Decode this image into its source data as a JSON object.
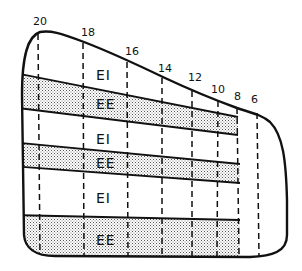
{
  "diagram": {
    "station_labels": [
      {
        "text": "20",
        "x": 33,
        "y": 25
      },
      {
        "text": "18",
        "x": 81,
        "y": 36
      },
      {
        "text": "16",
        "x": 125,
        "y": 55
      },
      {
        "text": "14",
        "x": 158,
        "y": 72
      },
      {
        "text": "12",
        "x": 188,
        "y": 81
      },
      {
        "text": "10",
        "x": 211,
        "y": 93
      },
      {
        "text": "8",
        "x": 234,
        "y": 100
      },
      {
        "text": "6",
        "x": 251,
        "y": 103
      }
    ],
    "zones": [
      {
        "text": "EI",
        "x": 96,
        "y": 80
      },
      {
        "text": "EE",
        "x": 96,
        "y": 109
      },
      {
        "text": "EI",
        "x": 96,
        "y": 144
      },
      {
        "text": "EE",
        "x": 96,
        "y": 168
      },
      {
        "text": "EI",
        "x": 96,
        "y": 203
      },
      {
        "text": "EE",
        "x": 96,
        "y": 245
      }
    ],
    "colors": {
      "line": "#111111",
      "shade": "#c8c8c8",
      "background": "#ffffff"
    }
  }
}
